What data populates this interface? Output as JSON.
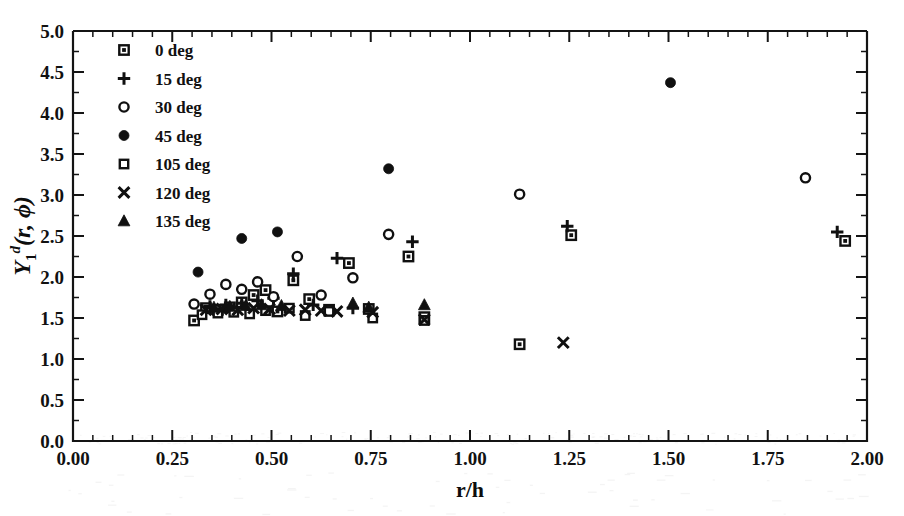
{
  "figure": {
    "background": "#ffffff",
    "ink_color": "#101010"
  },
  "chart_data": {
    "type": "scatter",
    "title": "",
    "xlabel": "r/h",
    "ylabel": "Y_1^d(r,phi)",
    "ylabel_parts": {
      "base": "Y",
      "subscript": "1",
      "superscript": "d",
      "argument": "(r, ϕ)"
    },
    "xlim": [
      0.0,
      2.0
    ],
    "ylim": [
      0.0,
      5.0
    ],
    "xticks": [
      "0.00",
      "0.25",
      "0.50",
      "0.75",
      "1.00",
      "1.25",
      "1.50",
      "1.75",
      "2.00"
    ],
    "xtick_values": [
      0.0,
      0.25,
      0.5,
      0.75,
      1.0,
      1.25,
      1.5,
      1.75,
      2.0
    ],
    "yticks": [
      "0.0",
      "0.5",
      "1.0",
      "1.5",
      "2.0",
      "2.5",
      "3.0",
      "3.5",
      "4.0",
      "4.5",
      "5.0"
    ],
    "ytick_values": [
      0.0,
      0.5,
      1.0,
      1.5,
      2.0,
      2.5,
      3.0,
      3.5,
      4.0,
      4.5,
      5.0
    ],
    "x_minor_per_major": 5,
    "y_minor_per_major": 2,
    "grid": false,
    "legend_position": "upper-left-inside",
    "series": [
      {
        "name": "0 deg",
        "label": "0 deg",
        "marker": "square-dot",
        "points": [
          [
            0.305,
            1.47
          ],
          [
            0.335,
            1.62
          ],
          [
            0.365,
            1.6
          ],
          [
            0.395,
            1.63
          ],
          [
            0.425,
            1.69
          ],
          [
            0.455,
            1.78
          ],
          [
            0.485,
            1.84
          ],
          [
            0.515,
            1.58
          ],
          [
            0.555,
            1.96
          ],
          [
            0.595,
            1.73
          ],
          [
            0.645,
            1.6
          ],
          [
            0.695,
            2.17
          ],
          [
            0.745,
            1.61
          ],
          [
            0.845,
            2.25
          ],
          [
            0.885,
            1.51
          ],
          [
            1.125,
            1.18
          ],
          [
            1.255,
            2.51
          ],
          [
            1.945,
            2.44
          ]
        ]
      },
      {
        "name": "15 deg",
        "label": "15 deg",
        "marker": "plus",
        "points": [
          [
            0.345,
            1.64
          ],
          [
            0.385,
            1.66
          ],
          [
            0.425,
            1.68
          ],
          [
            0.465,
            1.71
          ],
          [
            0.505,
            1.74
          ],
          [
            0.555,
            2.04
          ],
          [
            0.605,
            1.66
          ],
          [
            0.665,
            2.23
          ],
          [
            0.705,
            1.62
          ],
          [
            0.855,
            2.43
          ],
          [
            1.245,
            2.62
          ],
          [
            1.925,
            2.55
          ]
        ]
      },
      {
        "name": "30 deg",
        "label": "30 deg",
        "marker": "circle-open",
        "points": [
          [
            0.305,
            1.67
          ],
          [
            0.345,
            1.79
          ],
          [
            0.385,
            1.91
          ],
          [
            0.425,
            1.85
          ],
          [
            0.465,
            1.94
          ],
          [
            0.505,
            1.76
          ],
          [
            0.565,
            2.25
          ],
          [
            0.625,
            1.78
          ],
          [
            0.705,
            1.99
          ],
          [
            0.795,
            2.52
          ],
          [
            1.125,
            3.01
          ],
          [
            1.845,
            3.21
          ]
        ]
      },
      {
        "name": "45 deg",
        "label": "45 deg",
        "marker": "circle-filled",
        "points": [
          [
            0.315,
            2.06
          ],
          [
            0.425,
            2.47
          ],
          [
            0.515,
            2.55
          ],
          [
            0.795,
            3.32
          ],
          [
            1.505,
            4.37
          ]
        ]
      },
      {
        "name": "105 deg",
        "label": "105 deg",
        "marker": "square-open",
        "points": [
          [
            0.325,
            1.54
          ],
          [
            0.365,
            1.56
          ],
          [
            0.405,
            1.57
          ],
          [
            0.445,
            1.55
          ],
          [
            0.485,
            1.59
          ],
          [
            0.545,
            1.62
          ],
          [
            0.585,
            1.53
          ],
          [
            0.645,
            1.58
          ],
          [
            0.755,
            1.5
          ],
          [
            0.885,
            1.47
          ]
        ]
      },
      {
        "name": "120 deg",
        "label": "120 deg",
        "marker": "cross",
        "points": [
          [
            0.335,
            1.6
          ],
          [
            0.375,
            1.61
          ],
          [
            0.415,
            1.6
          ],
          [
            0.455,
            1.62
          ],
          [
            0.495,
            1.61
          ],
          [
            0.545,
            1.59
          ],
          [
            0.585,
            1.6
          ],
          [
            0.625,
            1.59
          ],
          [
            0.665,
            1.58
          ],
          [
            0.755,
            1.57
          ],
          [
            0.885,
            1.48
          ],
          [
            1.235,
            1.2
          ]
        ]
      },
      {
        "name": "135 deg",
        "label": "135 deg",
        "marker": "triangle-filled",
        "points": [
          [
            0.355,
            1.63
          ],
          [
            0.395,
            1.64
          ],
          [
            0.435,
            1.65
          ],
          [
            0.475,
            1.66
          ],
          [
            0.525,
            1.65
          ],
          [
            0.705,
            1.68
          ],
          [
            0.745,
            1.63
          ],
          [
            0.885,
            1.66
          ]
        ]
      }
    ]
  },
  "legend": {
    "entries": [
      {
        "label": "0 deg",
        "marker": "square-dot"
      },
      {
        "label": "15 deg",
        "marker": "plus"
      },
      {
        "label": "30 deg",
        "marker": "circle-open"
      },
      {
        "label": "45 deg",
        "marker": "circle-filled"
      },
      {
        "label": "105 deg",
        "marker": "square-open"
      },
      {
        "label": "120 deg",
        "marker": "cross"
      },
      {
        "label": "135 deg",
        "marker": "triangle-filled"
      }
    ]
  }
}
